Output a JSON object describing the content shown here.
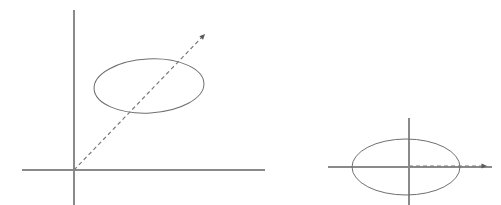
{
  "figure": {
    "title": "",
    "caption": "",
    "background_color": "#ffffff",
    "width": 501,
    "height": 205,
    "panel_count": 2
  },
  "style": {
    "axis_color": "#8a8a8a",
    "axis_width": 1.1,
    "curve_color": "#6f6f6f",
    "curve_width": 1.0,
    "dash_color": "#7a7a7a",
    "dash_width": 1.2,
    "dash_pattern": "4 3",
    "arrow_color": "#5a5a5a"
  },
  "panels": [
    {
      "name": "left-panel",
      "label": "",
      "origin": {
        "x": 74,
        "y": 170
      },
      "axes": {
        "vertical": {
          "x": 74,
          "y_top": 10,
          "y_bottom": 205,
          "label": ""
        },
        "horizontal": {
          "y": 170,
          "x_left": 22,
          "x_right": 265,
          "label": ""
        }
      },
      "ellipse": {
        "name": "tilted-ellipse",
        "cx": 149,
        "cy": 86,
        "rx": 55,
        "ry": 27,
        "rotation_deg": -3,
        "label": ""
      },
      "ray": {
        "name": "dashed-diagonal-ray",
        "x1": 74,
        "y1": 170,
        "x2": 205,
        "y2": 34,
        "style": "dashed",
        "arrow": "end",
        "label": ""
      }
    },
    {
      "name": "right-panel",
      "label": "",
      "origin": {
        "x": 409,
        "y": 167
      },
      "axes": {
        "vertical": {
          "x": 409,
          "y_top": 118,
          "y_bottom": 205,
          "label": ""
        },
        "horizontal": {
          "y": 167,
          "x_left": 328,
          "x_right": 492,
          "label": ""
        }
      },
      "ellipse": {
        "name": "centered-ellipse",
        "cx": 406,
        "cy": 167,
        "rx": 54,
        "ry": 28,
        "rotation_deg": 0,
        "label": ""
      },
      "ray": {
        "name": "dashed-horizontal-ray",
        "x1": 409,
        "y1": 166,
        "x2": 487,
        "y2": 166,
        "style": "dashed",
        "arrow": "end",
        "label": ""
      }
    }
  ]
}
